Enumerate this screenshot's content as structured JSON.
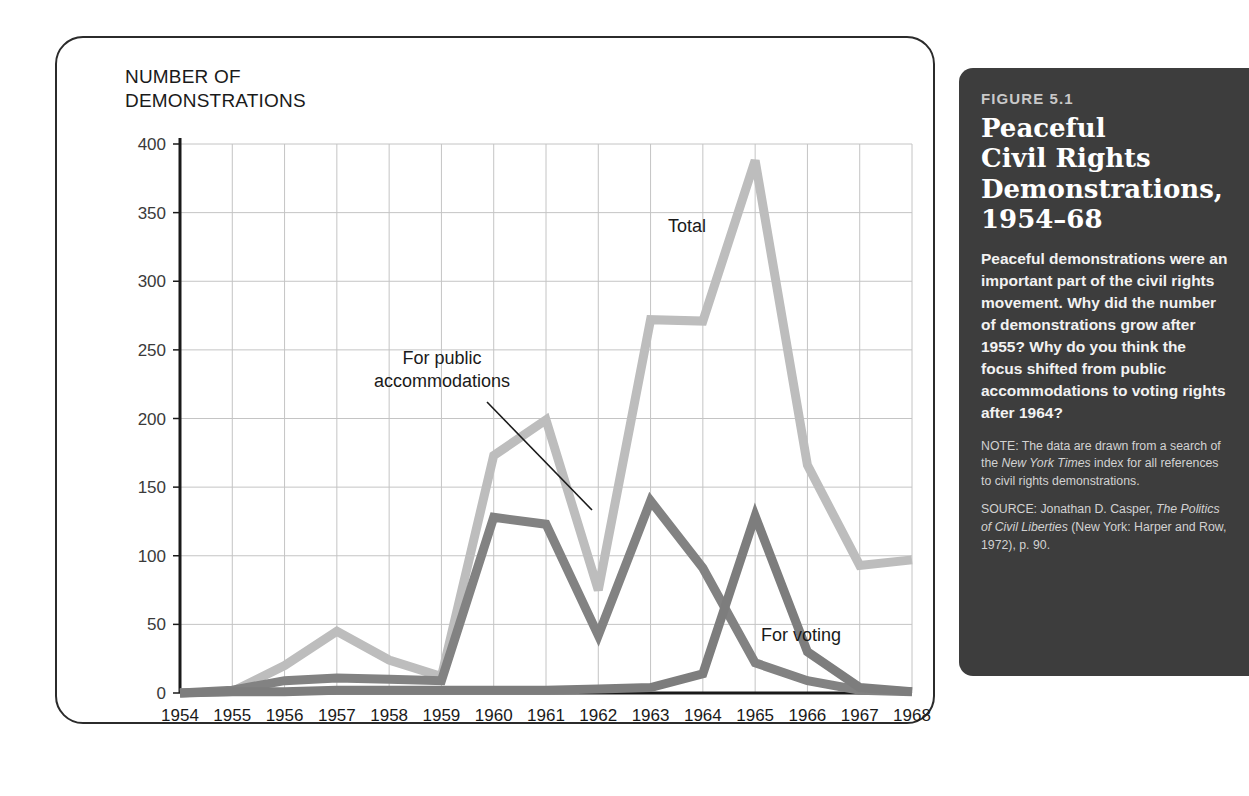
{
  "chart_data": {
    "type": "line",
    "title": "Peaceful Civil Rights Demonstrations, 1954–68",
    "ylabel": "NUMBER OF\nDEMONSTRATIONS",
    "xlabel": "",
    "grid": true,
    "legend_position": "inline-annotations",
    "ylim": [
      0,
      400
    ],
    "yticks": [
      0,
      50,
      100,
      150,
      200,
      250,
      300,
      350,
      400
    ],
    "categories": [
      1954,
      1955,
      1956,
      1957,
      1958,
      1959,
      1960,
      1961,
      1962,
      1963,
      1964,
      1965,
      1966,
      1967,
      1968
    ],
    "series": [
      {
        "name": "Total",
        "color": "#bdbdbd",
        "values": [
          0,
          1,
          20,
          45,
          24,
          12,
          173,
          199,
          75,
          272,
          271,
          388,
          166,
          93,
          97
        ]
      },
      {
        "name": "For public accommodations",
        "color": "#828282",
        "values": [
          0,
          2,
          9,
          11,
          10,
          9,
          128,
          123,
          42,
          140,
          91,
          22,
          9,
          2,
          1
        ]
      },
      {
        "name": "For voting",
        "color": "#7d7d7d",
        "values": [
          0,
          1,
          1,
          2,
          2,
          2,
          2,
          2,
          3,
          4,
          14,
          129,
          30,
          4,
          1
        ]
      }
    ],
    "annotations": [
      {
        "text": "Total",
        "series": "Total"
      },
      {
        "text": "For public\naccommodations",
        "series": "For public accommodations"
      },
      {
        "text": "For voting",
        "series": "For voting"
      }
    ]
  },
  "caption": {
    "figure_number": "FIGURE 5.1",
    "title": "Peaceful\nCivil Rights\nDemonstrations,\n1954–68",
    "body": "Peaceful demonstrations were an important part of the civil rights movement. Why did the number of demonstrations grow after 1955? Why do you think the focus shifted from public accommodations to voting rights after 1964?",
    "note_label": "NOTE:",
    "note_part1": " The data are drawn from a search of the ",
    "note_italic": "New York Times",
    "note_part2": " index for all references to civil rights demonstrations.",
    "source_label": "SOURCE:",
    "source_part1": " Jonathan D. Casper, ",
    "source_italic": "The Politics of Civil Liberties",
    "source_part2": " (New York: Harper and Row, 1972), p. 90."
  },
  "colors": {
    "panel_background": "#3d3d3d",
    "total_line": "#bdbdbd",
    "accommodations_line": "#828282",
    "voting_line": "#7d7d7d",
    "grid": "#c4c4c4",
    "axis": "#1a1a1a"
  }
}
